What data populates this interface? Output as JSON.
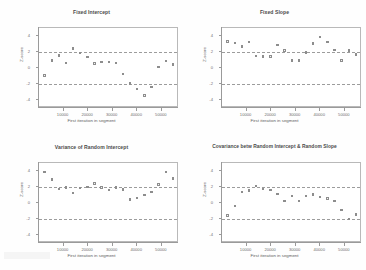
{
  "figure": {
    "layout": "2x2 grid of scatter panels",
    "shared_xlabel": "First iteration in segment",
    "shared_ylabel": "Z-score",
    "reference_lines": [
      1.96,
      -1.96
    ],
    "xticks": [
      "10000",
      "20000",
      "30000",
      "40000",
      "50000"
    ],
    "yticks": [
      "-4",
      "-2",
      "0",
      "2",
      "4"
    ]
  },
  "chart_data": [
    {
      "type": "scatter",
      "title": "Fixed Intercept",
      "xlabel": "First iteration in segment",
      "ylabel": "Z-score",
      "xlim": [
        0,
        57000
      ],
      "ylim": [
        -5,
        5
      ],
      "xticks": [
        10000,
        20000,
        30000,
        40000,
        50000
      ],
      "yticks": [
        -4,
        -2,
        0,
        2,
        4
      ],
      "grid": false,
      "hlines": [
        1.96,
        -1.96
      ],
      "x": [
        2300,
        5200,
        8100,
        11000,
        13900,
        16800,
        19700,
        22600,
        25500,
        28400,
        31300,
        34200,
        37100,
        40000,
        42900,
        45800,
        48700,
        51600,
        54500
      ],
      "y": [
        -0.95,
        0.95,
        1.55,
        0.65,
        2.45,
        1.85,
        1.35,
        0.55,
        0.72,
        0.78,
        0.6,
        -0.75,
        -1.95,
        -2.6,
        -3.45,
        -2.35,
        0.15,
        0.85,
        0.45
      ]
    },
    {
      "type": "scatter",
      "title": "Fixed Slope",
      "xlabel": "First iteration in segment",
      "ylabel": "Z-score",
      "xlim": [
        0,
        57000
      ],
      "ylim": [
        -5,
        5
      ],
      "xticks": [
        10000,
        20000,
        30000,
        40000,
        50000
      ],
      "yticks": [
        -4,
        -2,
        0,
        2,
        4
      ],
      "grid": false,
      "hlines": [
        1.96,
        -1.96
      ],
      "x": [
        2300,
        5200,
        8100,
        11000,
        13900,
        16800,
        19700,
        22600,
        25500,
        28400,
        31300,
        34200,
        37100,
        40000,
        42900,
        45800,
        48700,
        51600,
        54500
      ],
      "y": [
        3.3,
        3.1,
        2.7,
        3.25,
        1.5,
        1.45,
        1.45,
        2.85,
        2.2,
        0.95,
        0.95,
        1.95,
        3.05,
        3.9,
        3.25,
        2.25,
        0.95,
        2.2,
        1.7
      ]
    },
    {
      "type": "scatter",
      "title": "Variance of Random Intercept",
      "xlabel": "First iteration in segment",
      "ylabel": "Z-score",
      "xlim": [
        0,
        57000
      ],
      "ylim": [
        -5,
        5
      ],
      "xticks": [
        10000,
        20000,
        30000,
        40000,
        50000
      ],
      "yticks": [
        -4,
        -2,
        0,
        2,
        4
      ],
      "grid": false,
      "hlines": [
        1.96,
        -1.96
      ],
      "x": [
        2300,
        5200,
        8100,
        11000,
        13900,
        16800,
        19700,
        22600,
        25500,
        28400,
        31300,
        34200,
        37100,
        40000,
        42900,
        45800,
        48700,
        51600,
        54500
      ],
      "y": [
        3.85,
        2.95,
        1.75,
        1.95,
        1.25,
        1.85,
        2.0,
        2.45,
        1.95,
        1.6,
        1.95,
        1.7,
        0.45,
        0.6,
        1.0,
        1.35,
        2.3,
        3.9,
        3.05,
        0.85
      ]
    },
    {
      "type": "scatter",
      "title": "Covariance betw Random Intercept & Random Slope",
      "xlabel": "First iteration in segment",
      "ylabel": "Z-score",
      "xlim": [
        0,
        57000
      ],
      "ylim": [
        -5,
        5
      ],
      "xticks": [
        10000,
        20000,
        30000,
        40000,
        50000
      ],
      "yticks": [
        -4,
        -2,
        0,
        2,
        4
      ],
      "grid": false,
      "hlines": [
        1.96,
        -1.96
      ],
      "x": [
        2300,
        5200,
        8100,
        11000,
        13900,
        16800,
        19700,
        22600,
        25500,
        28400,
        31300,
        34200,
        37100,
        40000,
        42900,
        45800,
        48700,
        51600,
        54500
      ],
      "y": [
        -1.55,
        -0.35,
        1.35,
        1.55,
        2.15,
        1.75,
        1.65,
        1.15,
        0.25,
        0.85,
        0.25,
        0.85,
        1.05,
        0.75,
        0.55,
        0.25,
        -0.85,
        -2.0,
        -1.45,
        -0.95
      ]
    }
  ]
}
